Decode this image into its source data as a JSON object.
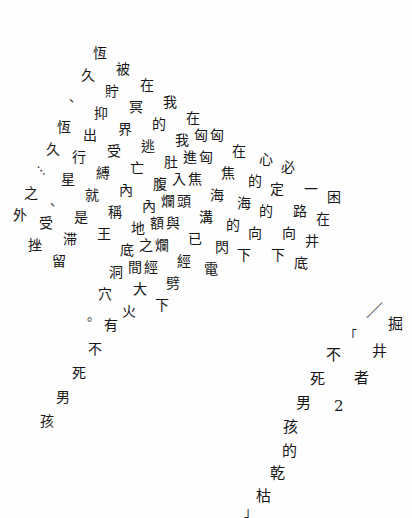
{
  "page": {
    "kind": "scanned-poem-page",
    "width": 412,
    "height": 518,
    "background_color": "#fefefe",
    "ink_color": "#171717",
    "language": "zh-Hant",
    "layout_note": "diagonal-columns"
  },
  "title_block": {
    "slash_mark": "／",
    "main_title": {
      "chars": [
        "掘",
        "井",
        "者"
      ],
      "text": "掘井者"
    },
    "series_number": "2",
    "open_bracket": "「",
    "close_bracket": "」",
    "subtitle": {
      "chars": [
        "不",
        "死",
        "男",
        "孩",
        "的",
        "乾",
        "枯"
      ],
      "text": "不死男孩的乾枯"
    }
  },
  "poem": {
    "columns": [
      {
        "id": "c1",
        "text": "恆久、",
        "chars": [
          "恆",
          "久",
          "、"
        ],
        "x": 93,
        "y": 46,
        "dx": -12,
        "dy": 22
      },
      {
        "id": "c2",
        "text": "被貯抑出行星、受挫",
        "chars": [
          "被",
          "貯",
          "抑",
          "出",
          "行",
          "星",
          "、",
          "受",
          "挫"
        ],
        "x": 116,
        "y": 62,
        "dx": -11,
        "dy": 22
      },
      {
        "id": "c3",
        "text": "恆久⋯之外",
        "chars": [
          "恆",
          "久",
          "⋯",
          "之",
          "外"
        ],
        "x": 57,
        "y": 120,
        "dx": -11,
        "dy": 22
      },
      {
        "id": "c4",
        "text": "在冥界受縛就是滞留",
        "chars": [
          "在",
          "冥",
          "界",
          "受",
          "縛",
          "就",
          "是",
          "滞",
          "留"
        ],
        "x": 140,
        "y": 78,
        "dx": -11,
        "dy": 22
      },
      {
        "id": "c5",
        "text": "我的逃亡就是稱王",
        "chars": [
          "我",
          "的",
          "逃",
          "亡",
          "內",
          "稱",
          "王"
        ],
        "x": 163,
        "y": 95,
        "dx": -11,
        "dy": 22
      },
      {
        "id": "c6",
        "text": "在我肚腹內地底洞穴。",
        "chars": [
          "在",
          "我",
          "肚",
          "腹",
          "內",
          "地",
          "底",
          "洞",
          "穴",
          "。"
        ],
        "x": 186,
        "y": 111,
        "dx": -11,
        "dy": 22
      },
      {
        "id": "c7",
        "text": "匠匈進入爛額之間",
        "chars": [
          "匈",
          "進",
          "入",
          "爛",
          "額",
          "之",
          "間"
        ],
        "x": 194,
        "y": 128,
        "dx": -11,
        "dy": 22
      },
      {
        "id": "c8",
        "text": "匈匈焦頭與爛經大火",
        "chars": [
          "匈",
          "匈",
          "焦",
          "頭",
          "與",
          "爛",
          "經",
          "大",
          "火"
        ],
        "x": 210,
        "y": 128,
        "dx": -11,
        "dy": 22
      },
      {
        "id": "c9",
        "text": "在焦海溝已經劈下",
        "chars": [
          "在",
          "焦",
          "海",
          "溝",
          "已",
          "經",
          "劈",
          "下"
        ],
        "x": 232,
        "y": 144,
        "dx": -11,
        "dy": 22
      },
      {
        "id": "c10",
        "text": "心的海的閃電",
        "chars": [
          "心",
          "的",
          "海",
          "的",
          "閃",
          "電"
        ],
        "x": 259,
        "y": 152,
        "dx": -11,
        "dy": 22
      },
      {
        "id": "c11",
        "text": "必定的一路向下",
        "chars": [
          "必",
          "定",
          "的",
          "向",
          "下"
        ],
        "x": 281,
        "y": 160,
        "dx": -11,
        "dy": 22
      },
      {
        "id": "c12",
        "text": "一路向下",
        "chars": [
          "一",
          "路",
          "向",
          "下"
        ],
        "x": 304,
        "y": 182,
        "dx": -11,
        "dy": 22
      },
      {
        "id": "c13",
        "text": "困在井底",
        "chars": [
          "困",
          "在",
          "井",
          "底"
        ],
        "x": 327,
        "y": 190,
        "dx": -11,
        "dy": 22
      },
      {
        "id": "c14",
        "text": "有不死男孩",
        "chars": [
          "有",
          "不",
          "死",
          "男",
          "孩"
        ],
        "x": 104,
        "y": 318,
        "dx": -16,
        "dy": 24
      }
    ],
    "full_text": "恆久、被貯抑出行星、受挫恆久⋯之外在冥界受縛就是滞留我的逃亡就是稱王在我肚腹內地底洞穴。匈進入爛額之間焦頭與已經劈下在心的海的閃電必定的一路向下困在井底有不死男孩"
  }
}
